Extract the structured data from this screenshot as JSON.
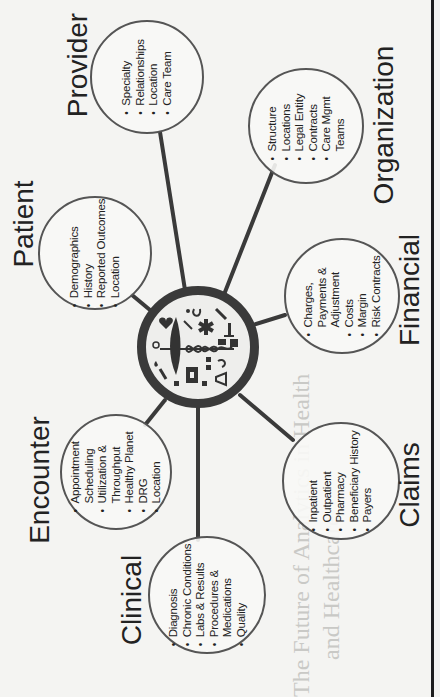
{
  "diagram": {
    "hub": {
      "icon": "caduceus-medical-icons",
      "description": "Central medical emblem: caduceus surrounded by health icons (stethoscope, heart, pill, syringe, ambulance, star of life, gender symbols, flask, microscope)"
    },
    "nodes": [
      {
        "id": "provider",
        "label": "Provider",
        "items": [
          "Specialty",
          "Relationships",
          "Location",
          "Care Team"
        ]
      },
      {
        "id": "organization",
        "label": "Organization",
        "items": [
          "Structure",
          "Locations",
          "Legal Entity",
          "Contracts",
          "Care Mgmt Teams"
        ]
      },
      {
        "id": "patient",
        "label": "Patient",
        "items": [
          "Demographics",
          "History",
          "Reported Outcomes",
          "Location"
        ]
      },
      {
        "id": "financial",
        "label": "Financial",
        "items": [
          "Charges, Payments & Adjustment",
          "Costs",
          "Margin",
          "Risk Contracts"
        ]
      },
      {
        "id": "encounter",
        "label": "Encounter",
        "items": [
          "Appointment Scheduling",
          "Utilization & Throughput",
          "Healthy Planet",
          "DRG",
          "Location"
        ]
      },
      {
        "id": "clinical",
        "label": "Clinical",
        "items": [
          "Diagnosis",
          "Chronic Conditions",
          "Labs & Results",
          "Procedures & Medications",
          "Quality"
        ]
      },
      {
        "id": "claims",
        "label": "Claims",
        "items": [
          "Inpatient",
          "Outpatient",
          "Pharmacy",
          "Beneficiary History",
          "Payers"
        ]
      }
    ],
    "orientation": "rotated 90 degrees counter-clockwise"
  },
  "bleed_through": {
    "title_line1": "The Future of Analytics in Health",
    "title_line2": "and Healthcare"
  },
  "colors": {
    "background": "#f4f4f2",
    "lines": "#3a3a3a",
    "circle_border": "#555555",
    "text": "#222222",
    "ghost_text": "#c9c9c6"
  }
}
